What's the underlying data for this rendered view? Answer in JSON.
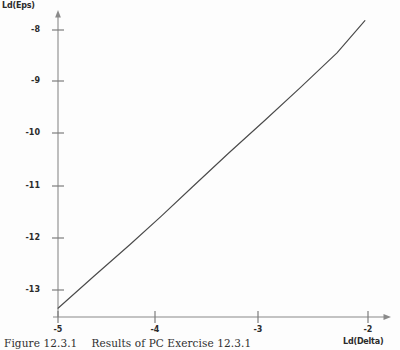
{
  "figure": {
    "caption_number": "Figure 12.3.1",
    "caption_text": "Results of PC Exercise 12.3.1"
  },
  "chart_data": {
    "type": "line",
    "title": "",
    "subtitle": "",
    "xlabel": "Ld(Delta)",
    "ylabel": "Ld(Eps)",
    "xlim": [
      -5.25,
      -1.8
    ],
    "ylim": [
      -13.6,
      -7.6
    ],
    "xticks": [
      -5,
      -4,
      -3,
      -2
    ],
    "xtick_labels": [
      "-5",
      "-4",
      "-3",
      "-2"
    ],
    "yticks": [
      -8,
      -9,
      -10,
      -11,
      -12,
      -13
    ],
    "ytick_labels": [
      "-8",
      "-9",
      "-10",
      "-11",
      "-12",
      "-13"
    ],
    "grid": false,
    "legend": null,
    "legend_position": "none",
    "axis_arrows": true,
    "series": [
      {
        "name": "Ld(Eps) vs Ld(Delta)",
        "color": "#4a4a4a",
        "x": [
          -5.0,
          -4.65,
          -4.3,
          -4.0,
          -3.7,
          -3.35,
          -3.0,
          -2.65,
          -2.3,
          -2.03
        ],
        "y": [
          -13.35,
          -12.73,
          -12.12,
          -11.58,
          -11.02,
          -10.37,
          -9.74,
          -9.1,
          -8.44,
          -7.82
        ]
      }
    ],
    "annotations": []
  }
}
